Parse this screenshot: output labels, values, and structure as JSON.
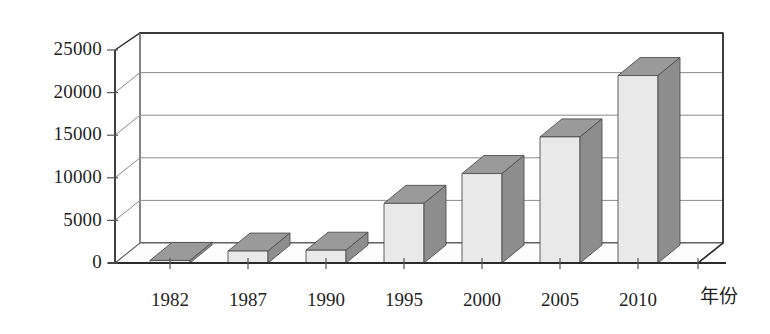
{
  "chart_data": {
    "type": "bar",
    "title": "",
    "subtitle": "",
    "xlabel": "年份",
    "ylabel": "",
    "categories": [
      "1982",
      "1987",
      "1990",
      "1995",
      "2000",
      "2005",
      "2010"
    ],
    "values": [
      300,
      1400,
      1500,
      7000,
      10500,
      14800,
      22000
    ],
    "ylim": [
      0,
      25000
    ],
    "yticks": [
      "0",
      "5000",
      "10000",
      "15000",
      "20000",
      "25000"
    ],
    "ytick_values": [
      0,
      5000,
      10000,
      15000,
      20000,
      25000
    ],
    "grid": true,
    "legend": "none",
    "style": "3d-column",
    "series": [
      {
        "name": "",
        "values": [
          300,
          1400,
          1500,
          7000,
          10500,
          14800,
          22000
        ]
      }
    ],
    "colors": {
      "bar_front": "#e9e9e9",
      "bar_side": "#8d8d8d",
      "bar_top": "#9a9a9a",
      "bar_edge": "#5a5a5a",
      "grid_line": "#8a8a8a",
      "axis_line": "#2b2b2b",
      "floor": "#fdfdfd",
      "wall": "#ffffff",
      "text": "#1f1f1f"
    }
  },
  "axis": {
    "x_title": "年份",
    "y_ticks": [
      "25000",
      "20000",
      "15000",
      "10000",
      "5000",
      "0"
    ],
    "x_ticks": [
      "1982",
      "1987",
      "1990",
      "1995",
      "2000",
      "2005",
      "2010"
    ]
  }
}
